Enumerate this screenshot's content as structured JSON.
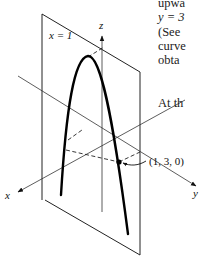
{
  "figure": {
    "plane_label": "x = 1",
    "axes": {
      "x": "x",
      "y": "y",
      "z": "z"
    },
    "point_label": "(1, 3, 0)",
    "colors": {
      "ink": "#111111",
      "background": "#ffffff"
    }
  },
  "side_text": {
    "lines": [
      "upwa",
      "y = 3",
      "(See",
      "curve",
      "obta"
    ],
    "paragraph2": "At th"
  }
}
